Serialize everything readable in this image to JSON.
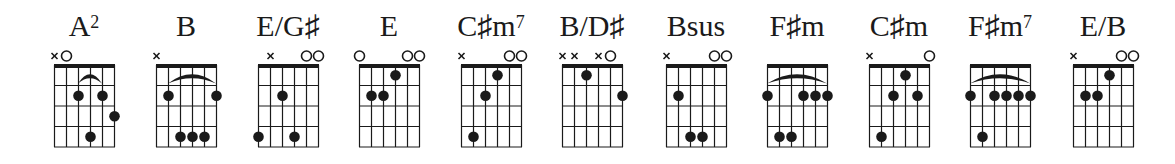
{
  "diagram": {
    "layout": {
      "grid_left_positions": [
        54,
        156,
        258,
        359,
        461,
        562,
        666,
        767,
        869,
        970,
        1073
      ],
      "string_spacing": 12,
      "fret_spacing": 20.5,
      "grid_top": 65,
      "frets_shown": 4
    },
    "colors": {
      "ink": "#1a1a1a",
      "background": "#ffffff"
    },
    "chords": [
      {
        "name": "A",
        "sup": "2",
        "markers": [
          "x",
          "o",
          "",
          "",
          "",
          ""
        ],
        "dots": [
          [
            3,
            2
          ],
          [
            4,
            4
          ],
          [
            5,
            2
          ],
          [
            6,
            3
          ]
        ],
        "barre": {
          "fret": 1,
          "from": 3,
          "to": 5,
          "arc": true
        }
      },
      {
        "name": "B",
        "sup": "",
        "markers": [
          "x",
          "",
          "",
          "",
          "",
          ""
        ],
        "dots": [
          [
            2,
            2
          ],
          [
            3,
            4
          ],
          [
            4,
            4
          ],
          [
            5,
            4
          ],
          [
            6,
            2
          ]
        ],
        "barre": {
          "fret": 1,
          "from": 2,
          "to": 6,
          "arc": true
        }
      },
      {
        "name": "E/G♯",
        "sup": "",
        "markers": [
          "",
          "x",
          "",
          "",
          "o",
          "o"
        ],
        "dots": [
          [
            1,
            4
          ],
          [
            3,
            2
          ],
          [
            4,
            4
          ]
        ],
        "barre": null
      },
      {
        "name": "E",
        "sup": "",
        "markers": [
          "o",
          "",
          "",
          "",
          "o",
          "o"
        ],
        "dots": [
          [
            2,
            2
          ],
          [
            3,
            2
          ],
          [
            4,
            1
          ]
        ],
        "barre": null
      },
      {
        "name": "C♯m",
        "sup": "7",
        "markers": [
          "x",
          "",
          "",
          "",
          "o",
          "o"
        ],
        "dots": [
          [
            2,
            4
          ],
          [
            3,
            2
          ],
          [
            4,
            1
          ]
        ],
        "barre": null
      },
      {
        "name": "B/D♯",
        "sup": "",
        "markers": [
          "x",
          "x",
          "",
          "x",
          "o",
          ""
        ],
        "dots": [
          [
            3,
            1
          ],
          [
            6,
            2
          ]
        ],
        "barre": null
      },
      {
        "name": "Bsus",
        "sup": "",
        "markers": [
          "x",
          "",
          "",
          "",
          "o",
          "o"
        ],
        "dots": [
          [
            2,
            2
          ],
          [
            3,
            4
          ],
          [
            4,
            4
          ]
        ],
        "barre": null
      },
      {
        "name": "F♯m",
        "sup": "",
        "markers": [
          "",
          "",
          "",
          "",
          "",
          ""
        ],
        "dots": [
          [
            1,
            2
          ],
          [
            2,
            4
          ],
          [
            3,
            4
          ],
          [
            4,
            2
          ],
          [
            5,
            2
          ],
          [
            6,
            2
          ]
        ],
        "barre": {
          "fret": 1,
          "from": 1,
          "to": 6,
          "arc": true
        }
      },
      {
        "name": "C♯m",
        "sup": "",
        "markers": [
          "x",
          "",
          "",
          "",
          "",
          "o"
        ],
        "dots": [
          [
            2,
            4
          ],
          [
            3,
            2
          ],
          [
            4,
            1
          ],
          [
            5,
            2
          ]
        ],
        "barre": null
      },
      {
        "name": "F♯m",
        "sup": "7",
        "markers": [
          "",
          "",
          "",
          "",
          "",
          ""
        ],
        "dots": [
          [
            1,
            2
          ],
          [
            2,
            4
          ],
          [
            3,
            2
          ],
          [
            4,
            2
          ],
          [
            5,
            2
          ],
          [
            6,
            2
          ]
        ],
        "barre": {
          "fret": 1,
          "from": 1,
          "to": 6,
          "arc": true
        }
      },
      {
        "name": "E/B",
        "sup": "",
        "markers": [
          "x",
          "",
          "",
          "",
          "o",
          "o"
        ],
        "dots": [
          [
            2,
            2
          ],
          [
            3,
            2
          ],
          [
            4,
            1
          ]
        ],
        "barre": null
      }
    ]
  }
}
